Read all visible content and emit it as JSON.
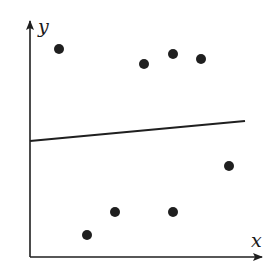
{
  "chart_data": {
    "type": "scatter",
    "title": "",
    "xlabel": "x",
    "ylabel": "y",
    "grid": false,
    "legend": null,
    "tick_labels": false,
    "points_pixel": [
      {
        "x": 59,
        "y": 49
      },
      {
        "x": 144,
        "y": 64
      },
      {
        "x": 173,
        "y": 54
      },
      {
        "x": 201,
        "y": 59
      },
      {
        "x": 229,
        "y": 166
      },
      {
        "x": 87,
        "y": 235
      },
      {
        "x": 115,
        "y": 212
      },
      {
        "x": 173,
        "y": 212
      }
    ],
    "points_relative": [
      {
        "x": 0.13,
        "y": 0.87
      },
      {
        "x": 0.49,
        "y": 0.81
      },
      {
        "x": 0.62,
        "y": 0.85
      },
      {
        "x": 0.74,
        "y": 0.83
      },
      {
        "x": 0.86,
        "y": 0.38
      },
      {
        "x": 0.25,
        "y": 0.09
      },
      {
        "x": 0.37,
        "y": 0.19
      },
      {
        "x": 0.62,
        "y": 0.19
      }
    ],
    "fit_line": {
      "x1": 0.0,
      "y1": 0.49,
      "x2": 0.92,
      "y2": 0.58,
      "description": "nearly horizontal, slightly increasing regression line"
    },
    "colors": {
      "points": "#1f1f1f",
      "line": "#1f1f1f",
      "axes": "#1f1f1f"
    }
  },
  "labels": {
    "x": "x",
    "y": "y"
  }
}
